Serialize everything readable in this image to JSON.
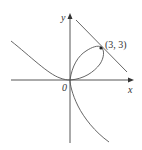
{
  "diagram": {
    "curve": "folium of Descartes x^3 + y^3 = 6xy",
    "axis_labels": {
      "x": "x",
      "y": "y"
    },
    "origin_label": "0",
    "point_label": "(3, 3)",
    "tangent_line": "x + y = 6",
    "colors": {
      "curve": "#555555",
      "axes": "#444444",
      "background": "#ffffff"
    }
  }
}
